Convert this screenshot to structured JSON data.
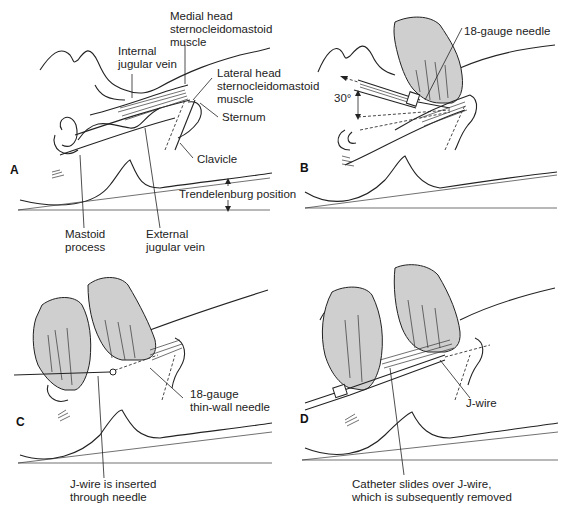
{
  "figure": {
    "colors": {
      "line": "#222222",
      "hand_fill": "#cfcfcf",
      "background": "#ffffff"
    },
    "panels": [
      {
        "letter": "A",
        "labels": {
          "medial_head": "Medial head\nsternocleidomastoid\nmuscle",
          "internal_jugular": "Internal\njugular vein",
          "lateral_head": "Lateral head\nsternocleidomastoid\nmuscle",
          "sternum": "Sternum",
          "clavicle": "Clavicle",
          "trendelenburg": "Trendelenburg position",
          "mastoid": "Mastoid\nprocess",
          "external_jugular": "External\njugular vein"
        }
      },
      {
        "letter": "B",
        "labels": {
          "needle": "18-gauge needle",
          "angle": "30°"
        }
      },
      {
        "letter": "C",
        "labels": {
          "thin_wall_needle": "18-gauge\nthin-wall needle",
          "jwire_inserted": "J-wire is inserted\nthrough needle"
        }
      },
      {
        "letter": "D",
        "labels": {
          "jwire": "J-wire",
          "catheter": "Catheter slides over J-wire,\nwhich is subsequently removed"
        }
      }
    ]
  }
}
